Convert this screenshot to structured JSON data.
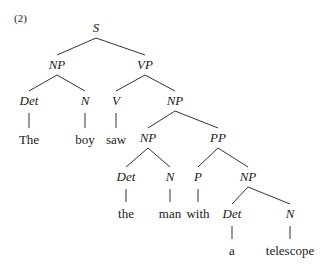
{
  "example_number": "(2)",
  "tree": {
    "nodes": [
      {
        "id": "S",
        "label": "S",
        "type": "category",
        "x": 96,
        "y": 28
      },
      {
        "id": "NP1",
        "label": "NP",
        "type": "category",
        "x": 57,
        "y": 65
      },
      {
        "id": "VP",
        "label": "VP",
        "type": "category",
        "x": 145,
        "y": 65
      },
      {
        "id": "Det1",
        "label": "Det",
        "type": "category",
        "x": 29,
        "y": 101
      },
      {
        "id": "N1",
        "label": "N",
        "type": "category",
        "x": 85,
        "y": 101
      },
      {
        "id": "V",
        "label": "V",
        "type": "category",
        "x": 116,
        "y": 101
      },
      {
        "id": "NP2",
        "label": "NP",
        "type": "category",
        "x": 175,
        "y": 101
      },
      {
        "id": "w_The",
        "label": "The",
        "type": "word",
        "x": 29,
        "y": 140
      },
      {
        "id": "w_boy",
        "label": "boy",
        "type": "word",
        "x": 85,
        "y": 140
      },
      {
        "id": "w_saw",
        "label": "saw",
        "type": "word",
        "x": 116,
        "y": 140
      },
      {
        "id": "NP3",
        "label": "NP",
        "type": "category",
        "x": 148,
        "y": 138
      },
      {
        "id": "PP",
        "label": "PP",
        "type": "category",
        "x": 218,
        "y": 138
      },
      {
        "id": "Det2",
        "label": "Det",
        "type": "category",
        "x": 126,
        "y": 177
      },
      {
        "id": "N2",
        "label": "N",
        "type": "category",
        "x": 170,
        "y": 177
      },
      {
        "id": "P",
        "label": "P",
        "type": "category",
        "x": 198,
        "y": 177
      },
      {
        "id": "NP4",
        "label": "NP",
        "type": "category",
        "x": 248,
        "y": 177
      },
      {
        "id": "w_the",
        "label": "the",
        "type": "word",
        "x": 126,
        "y": 214
      },
      {
        "id": "w_man",
        "label": "man",
        "type": "word",
        "x": 170,
        "y": 214
      },
      {
        "id": "w_with",
        "label": "with",
        "type": "word",
        "x": 198,
        "y": 214
      },
      {
        "id": "Det3",
        "label": "Det",
        "type": "category",
        "x": 232,
        "y": 214
      },
      {
        "id": "N3",
        "label": "N",
        "type": "category",
        "x": 290,
        "y": 214
      },
      {
        "id": "w_a",
        "label": "a",
        "type": "word",
        "x": 232,
        "y": 251
      },
      {
        "id": "w_telescope",
        "label": "telescope",
        "type": "word",
        "x": 290,
        "y": 251
      }
    ],
    "edges": [
      [
        "S",
        "NP1"
      ],
      [
        "S",
        "VP"
      ],
      [
        "NP1",
        "Det1"
      ],
      [
        "NP1",
        "N1"
      ],
      [
        "VP",
        "V"
      ],
      [
        "VP",
        "NP2"
      ],
      [
        "Det1",
        "w_The"
      ],
      [
        "N1",
        "w_boy"
      ],
      [
        "V",
        "w_saw"
      ],
      [
        "NP2",
        "NP3"
      ],
      [
        "NP2",
        "PP"
      ],
      [
        "NP3",
        "Det2"
      ],
      [
        "NP3",
        "N2"
      ],
      [
        "PP",
        "P"
      ],
      [
        "PP",
        "NP4"
      ],
      [
        "Det2",
        "w_the"
      ],
      [
        "N2",
        "w_man"
      ],
      [
        "P",
        "w_with"
      ],
      [
        "NP4",
        "Det3"
      ],
      [
        "NP4",
        "N3"
      ],
      [
        "Det3",
        "w_a"
      ],
      [
        "N3",
        "w_telescope"
      ]
    ]
  }
}
